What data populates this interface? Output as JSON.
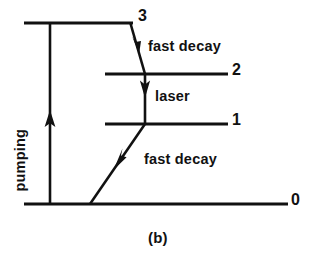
{
  "figure": {
    "caption": "(b)",
    "kind": "energy-level-diagram",
    "background_color": "#ffffff",
    "ink_color": "#111111"
  },
  "levels": [
    {
      "id": "level-3",
      "label": "3",
      "energy_rank": 3,
      "line": {
        "x1": 24,
        "x2": 133,
        "y": 23
      },
      "label_pos": {
        "x": 138,
        "y": 8
      }
    },
    {
      "id": "level-2",
      "label": "2",
      "energy_rank": 2,
      "line": {
        "x1": 105,
        "x2": 228,
        "y": 74
      },
      "label_pos": {
        "x": 232,
        "y": 62
      }
    },
    {
      "id": "level-1",
      "label": "1",
      "energy_rank": 1,
      "line": {
        "x1": 105,
        "x2": 228,
        "y": 124
      },
      "label_pos": {
        "x": 232,
        "y": 112
      }
    },
    {
      "id": "level-0",
      "label": "0",
      "energy_rank": 0,
      "line": {
        "x1": 24,
        "x2": 288,
        "y": 204
      },
      "label_pos": {
        "x": 291,
        "y": 192
      }
    }
  ],
  "transitions": [
    {
      "id": "pumping",
      "label": "pumping",
      "from_level": "0",
      "to_level": "3",
      "direction": "up",
      "style": "vertical",
      "label_rotated": true
    },
    {
      "id": "fast-decay-top",
      "label": "fast decay",
      "from_level": "3",
      "to_level": "2",
      "direction": "down",
      "style": "diagonal"
    },
    {
      "id": "laser",
      "label": "laser",
      "from_level": "2",
      "to_level": "1",
      "direction": "down",
      "style": "vertical"
    },
    {
      "id": "fast-decay-bottom",
      "label": "fast decay",
      "from_level": "1",
      "to_level": "0",
      "direction": "down",
      "style": "diagonal"
    }
  ],
  "labels": {
    "level_3": "3",
    "level_2": "2",
    "level_1": "1",
    "level_0": "0",
    "fast_decay_top": "fast decay",
    "laser": "laser",
    "fast_decay_bottom": "fast decay",
    "pumping": "pumping",
    "caption": "(b)"
  }
}
